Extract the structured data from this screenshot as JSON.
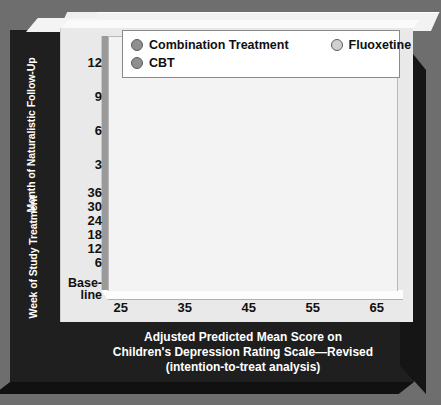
{
  "figure": {
    "background_color": "#6e6e6e",
    "panel_color": "#1f1f1f",
    "plot_color": "#f3f3f3"
  },
  "legend": {
    "items": [
      {
        "label": "Combination Treatment",
        "color": "#8f8f8f",
        "marker": "circle-marker"
      },
      {
        "label": "Fluoxetine",
        "color": "#d0d0d0",
        "marker": "circle-marker"
      },
      {
        "label": "CBT",
        "color": "#8f8f8f",
        "marker": "circle-marker"
      }
    ]
  },
  "axes": {
    "y_title_upper": "Month of Naturalistic Follow-Up",
    "y_title_lower": "Week of Study Treatment",
    "y_ticks": [
      "12",
      "9",
      "6",
      "3",
      "36",
      "30",
      "24",
      "18",
      "12",
      "6"
    ],
    "y_baseline_line1": "Base-",
    "y_baseline_line2": "line",
    "x_ticks": [
      "25",
      "35",
      "45",
      "55",
      "65"
    ],
    "x_caption_line1": "Adjusted Predicted Mean Score on",
    "x_caption_line2": "Children's Depression Rating Scale—Revised",
    "x_caption_line3": "(intention-to-treat analysis)"
  },
  "chart_data": {
    "type": "line",
    "title": "",
    "xlabel": "Adjusted Predicted Mean Score on Children's Depression Rating Scale—Revised (intention-to-treat analysis)",
    "ylabel": "Week of Study Treatment / Month of Naturalistic Follow-Up",
    "xlim": [
      23,
      68
    ],
    "ylim_categories": [
      "Baseline",
      "6",
      "12",
      "18",
      "24",
      "30",
      "36",
      "3",
      "6",
      "9",
      "12"
    ],
    "y_note": "Weeks 6-36 are study treatment; months 3-12 are naturalistic follow-up. Axis runs bottom (Baseline) to top (month 12).",
    "grid": true,
    "legend_position": "top",
    "categories": [
      "Baseline",
      "6",
      "12",
      "18",
      "24",
      "30",
      "36",
      "3",
      "6",
      "9",
      "12"
    ],
    "series": [
      {
        "name": "Combination Treatment",
        "color": "#8f8f8f",
        "values": [
          60.1,
          43.5,
          40.2,
          38.4,
          36.3,
          34.9,
          33.5,
          31.3,
          29.7,
          28.4,
          27.3
        ]
      },
      {
        "name": "Fluoxetine",
        "color": "#d0d0d0",
        "values": [
          59.4,
          40.0,
          37.8,
          35.9,
          34.4,
          33.0,
          31.8,
          30.7,
          29.4,
          28.2,
          27.1
        ]
      },
      {
        "name": "CBT",
        "color": "#8f8f8f",
        "values": [
          58.5,
          38.5,
          36.6,
          35.1,
          33.7,
          32.3,
          31.1,
          30.0,
          29.1,
          28.0,
          26.9
        ]
      }
    ]
  }
}
